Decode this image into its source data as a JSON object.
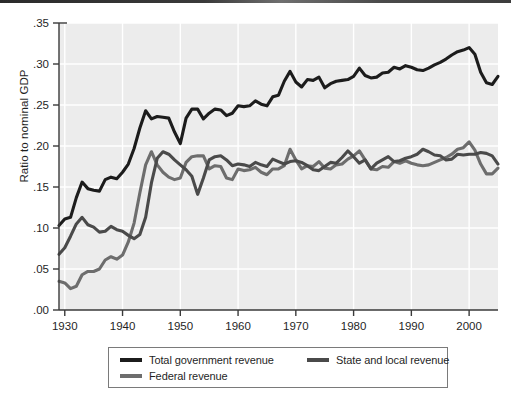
{
  "chart_data": {
    "type": "line",
    "title": "",
    "xlabel": "",
    "ylabel": "Ratio to nominal GDP",
    "xlim": [
      1929,
      2005
    ],
    "ylim": [
      0.0,
      0.35
    ],
    "grid": true,
    "grid_color": "#ffffff",
    "plot_background": "#ececec",
    "legend_position": "below-axes",
    "xticks": [
      1930,
      1940,
      1950,
      1960,
      1970,
      1980,
      1990,
      2000
    ],
    "xtick_labels": [
      "1930",
      "1940",
      "1950",
      "1960",
      "1970",
      "1980",
      "1990",
      "2000"
    ],
    "yticks": [
      0.0,
      0.05,
      0.1,
      0.15,
      0.2,
      0.25,
      0.3,
      0.35
    ],
    "ytick_labels": [
      ".00",
      ".05",
      ".10",
      ".15",
      ".20",
      ".25",
      ".30",
      ".35"
    ],
    "x": [
      1929,
      1930,
      1931,
      1932,
      1933,
      1934,
      1935,
      1936,
      1937,
      1938,
      1939,
      1940,
      1941,
      1942,
      1943,
      1944,
      1945,
      1946,
      1947,
      1948,
      1949,
      1950,
      1951,
      1952,
      1953,
      1954,
      1955,
      1956,
      1957,
      1958,
      1959,
      1960,
      1961,
      1962,
      1963,
      1964,
      1965,
      1966,
      1967,
      1968,
      1969,
      1970,
      1971,
      1972,
      1973,
      1974,
      1975,
      1976,
      1977,
      1978,
      1979,
      1980,
      1981,
      1982,
      1983,
      1984,
      1985,
      1986,
      1987,
      1988,
      1989,
      1990,
      1991,
      1992,
      1993,
      1994,
      1995,
      1996,
      1997,
      1998,
      1999,
      2000,
      2001,
      2002,
      2003,
      2004,
      2005
    ],
    "series": [
      {
        "name": "Total government revenue",
        "color": "#1c1c1c",
        "linewidth": 3.1,
        "values": [
          0.103,
          0.111,
          0.113,
          0.137,
          0.156,
          0.148,
          0.146,
          0.145,
          0.159,
          0.162,
          0.16,
          0.168,
          0.178,
          0.197,
          0.222,
          0.243,
          0.233,
          0.236,
          0.235,
          0.234,
          0.217,
          0.203,
          0.234,
          0.245,
          0.245,
          0.233,
          0.24,
          0.245,
          0.244,
          0.237,
          0.24,
          0.249,
          0.248,
          0.249,
          0.255,
          0.251,
          0.249,
          0.26,
          0.262,
          0.279,
          0.291,
          0.278,
          0.272,
          0.281,
          0.28,
          0.284,
          0.271,
          0.276,
          0.279,
          0.28,
          0.281,
          0.285,
          0.295,
          0.286,
          0.283,
          0.284,
          0.289,
          0.29,
          0.296,
          0.294,
          0.298,
          0.296,
          0.293,
          0.292,
          0.295,
          0.299,
          0.302,
          0.306,
          0.311,
          0.315,
          0.317,
          0.32,
          0.312,
          0.29,
          0.277,
          0.275,
          0.285
        ]
      },
      {
        "name": "State and local revenue",
        "color": "#4a4a4a",
        "linewidth": 3.1,
        "values": [
          0.068,
          0.076,
          0.09,
          0.105,
          0.113,
          0.104,
          0.101,
          0.095,
          0.096,
          0.102,
          0.098,
          0.096,
          0.091,
          0.087,
          0.092,
          0.113,
          0.155,
          0.185,
          0.193,
          0.19,
          0.183,
          0.177,
          0.171,
          0.163,
          0.141,
          0.161,
          0.183,
          0.187,
          0.188,
          0.183,
          0.176,
          0.178,
          0.177,
          0.175,
          0.18,
          0.177,
          0.175,
          0.184,
          0.181,
          0.178,
          0.181,
          0.182,
          0.18,
          0.176,
          0.171,
          0.17,
          0.175,
          0.18,
          0.179,
          0.186,
          0.194,
          0.187,
          0.179,
          0.183,
          0.172,
          0.179,
          0.183,
          0.187,
          0.181,
          0.182,
          0.185,
          0.187,
          0.19,
          0.196,
          0.193,
          0.189,
          0.188,
          0.183,
          0.184,
          0.19,
          0.189,
          0.19,
          0.19,
          0.192,
          0.191,
          0.188,
          0.178
        ]
      },
      {
        "name": "Federal revenue",
        "color": "#6d6d6d",
        "linewidth": 3.1,
        "values": [
          0.035,
          0.033,
          0.026,
          0.029,
          0.043,
          0.047,
          0.047,
          0.05,
          0.061,
          0.065,
          0.062,
          0.067,
          0.083,
          0.106,
          0.143,
          0.177,
          0.193,
          0.177,
          0.168,
          0.162,
          0.159,
          0.161,
          0.18,
          0.187,
          0.188,
          0.188,
          0.172,
          0.176,
          0.175,
          0.161,
          0.159,
          0.172,
          0.17,
          0.171,
          0.174,
          0.168,
          0.165,
          0.172,
          0.172,
          0.176,
          0.196,
          0.183,
          0.172,
          0.176,
          0.175,
          0.181,
          0.173,
          0.172,
          0.177,
          0.178,
          0.184,
          0.188,
          0.194,
          0.183,
          0.172,
          0.171,
          0.175,
          0.174,
          0.181,
          0.179,
          0.182,
          0.179,
          0.177,
          0.176,
          0.177,
          0.18,
          0.183,
          0.186,
          0.19,
          0.196,
          0.198,
          0.205,
          0.195,
          0.178,
          0.166,
          0.166,
          0.173
        ]
      }
    ],
    "legend": [
      {
        "label": "Total government revenue",
        "color": "#1c1c1c"
      },
      {
        "label": "State and local revenue",
        "color": "#4a4a4a"
      },
      {
        "label": "Federal revenue",
        "color": "#6d6d6d"
      }
    ]
  }
}
